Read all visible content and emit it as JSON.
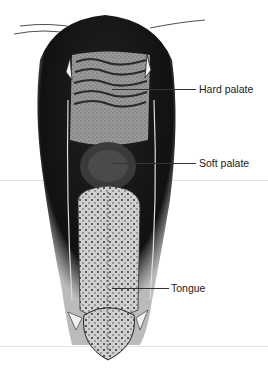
{
  "figure": {
    "labels": [
      {
        "id": "hard-palate",
        "text": "Hard palate"
      },
      {
        "id": "soft-palate",
        "text": "Soft palate"
      },
      {
        "id": "tongue",
        "text": "Tongue"
      }
    ]
  },
  "colors": {
    "background": "#ffffff",
    "ink": "#1a1a1a",
    "rule": "#e4e4e4"
  }
}
